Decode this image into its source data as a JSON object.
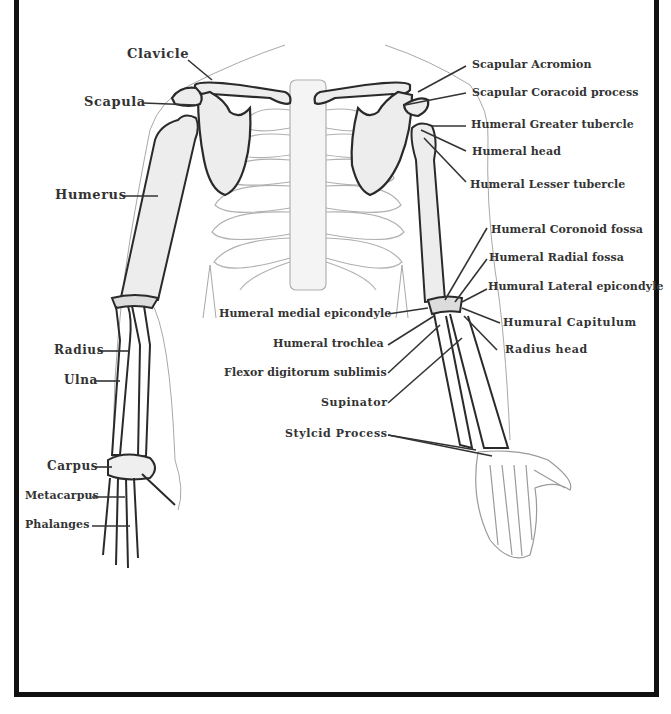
{
  "diagram": {
    "left_labels": [
      {
        "id": "clavicle",
        "text": "Clavicle"
      },
      {
        "id": "scapula",
        "text": "Scapula"
      },
      {
        "id": "humerus",
        "text": "Humerus"
      },
      {
        "id": "radius",
        "text": "Radius"
      },
      {
        "id": "ulna",
        "text": "Ulna"
      },
      {
        "id": "carpus",
        "text": "Carpus"
      },
      {
        "id": "metacarpus",
        "text": "Metacarpus"
      },
      {
        "id": "phalanges",
        "text": "Phalanges"
      }
    ],
    "right_labels": [
      {
        "id": "scapular-acromion",
        "text": "Scapular Acromion"
      },
      {
        "id": "scapular-coracoid",
        "text": "Scapular Coracoid process"
      },
      {
        "id": "humeral-greater-tubercle",
        "text": "Humeral Greater tubercle"
      },
      {
        "id": "humeral-head",
        "text": "Humeral head"
      },
      {
        "id": "humeral-lesser-tubercle",
        "text": "Humeral Lesser tubercle"
      },
      {
        "id": "humeral-coronoid-fossa",
        "text": "Humeral Coronoid fossa"
      },
      {
        "id": "humeral-radial-fossa",
        "text": "Humeral Radial fossa"
      },
      {
        "id": "humural-lateral-epicondyle",
        "text": "Humural Lateral epicondyle"
      },
      {
        "id": "humural-capitulum",
        "text": "Humural Capitulum"
      },
      {
        "id": "radius-head",
        "text": "Radius head"
      }
    ],
    "center_labels": [
      {
        "id": "humeral-medial-epicondyle",
        "text": "Humeral medial epicondyle"
      },
      {
        "id": "humeral-trochlea",
        "text": "Humeral trochlea"
      },
      {
        "id": "flexor-digitorum",
        "text": "Flexor digitorum sublimis"
      },
      {
        "id": "supinator",
        "text": "Supinator"
      },
      {
        "id": "styloid-process",
        "text": "Stylcid Process"
      }
    ],
    "colors": {
      "bone_outline": "#2a2a2a",
      "light_outline": "#9a9a9a",
      "bone_fill": "#ededed",
      "label": "#333333",
      "frame": "#111111"
    }
  }
}
